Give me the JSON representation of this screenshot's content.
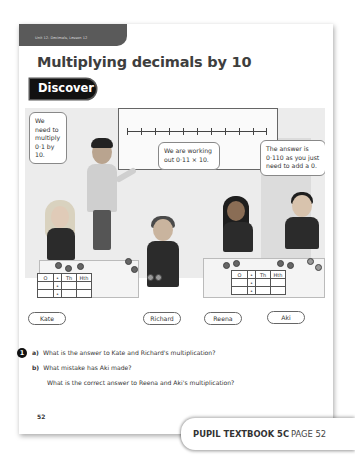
{
  "header": {
    "unit_strip": "Unit 12: Decimals, Lesson 12",
    "title": "Multiplying decimals by 10",
    "section_badge": "Discover"
  },
  "illustration": {
    "whiteboard": {
      "number_line_ticks": 11
    },
    "speech_bubbles": [
      {
        "speaker": "Teacher",
        "text": "We need to multiply 0·1 by 10."
      },
      {
        "speaker": "Reena",
        "text": "We are working out 0·11 × 10."
      },
      {
        "speaker": "Aki",
        "text": "The answer is 0·110 as you just need to add a 0."
      }
    ],
    "place_value_tables": [
      {
        "owner": "Kate and Richard",
        "headers": [
          "O",
          "•",
          "Th",
          "Hth"
        ],
        "rows": [
          [
            "",
            "•",
            "",
            ""
          ],
          [
            "",
            "•",
            "",
            ""
          ]
        ]
      },
      {
        "owner": "Reena and Aki",
        "headers": [
          "O",
          "•",
          "Th",
          "Hth"
        ],
        "rows": [
          [
            "",
            "•",
            "",
            ""
          ],
          [
            "",
            "•",
            "",
            ""
          ]
        ]
      }
    ],
    "name_labels": [
      "Kate",
      "Richard",
      "Reena",
      "Aki"
    ]
  },
  "questions": {
    "number": "1",
    "items": [
      {
        "letter": "a)",
        "text": "What is the answer to Kate and Richard's multiplication?"
      },
      {
        "letter": "b)",
        "text": "What mistake has Aki made?"
      },
      {
        "letter": "",
        "text": "What is the correct answer to Reena and Aki's multiplication?"
      }
    ]
  },
  "page_number": "52",
  "footer": {
    "book": "PUPIL TEXTBOOK 5C",
    "page": "PAGE 52"
  }
}
